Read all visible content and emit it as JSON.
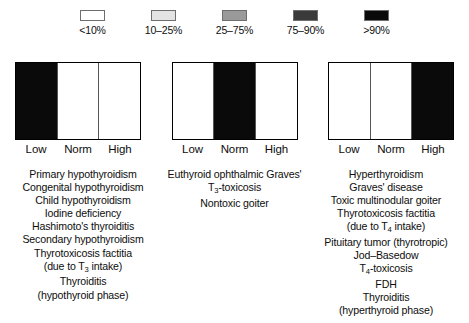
{
  "legend": {
    "items": [
      {
        "label": "<10%",
        "color": "#ffffff",
        "name": "legend-swatch-lt10"
      },
      {
        "label": "10–25%",
        "color": "#e3e3e3",
        "name": "legend-swatch-10-25"
      },
      {
        "label": "25–75%",
        "color": "#9a9a9a",
        "name": "legend-swatch-25-75"
      },
      {
        "label": "75–90%",
        "color": "#3a3a3a",
        "name": "legend-swatch-75-90"
      },
      {
        "label": ">90%",
        "color": "#0a0a0a",
        "name": "legend-swatch-gt90"
      }
    ]
  },
  "panels": [
    {
      "id": "panel-hypothyroid",
      "axis": [
        "Low",
        "Norm",
        "High"
      ],
      "bars": [
        {
          "segment": "Low",
          "color": "#0a0a0a",
          "band": ">90%"
        },
        {
          "segment": "Norm",
          "color": "#ffffff",
          "band": "<10%"
        },
        {
          "segment": "High",
          "color": "#ffffff",
          "band": "<10%"
        }
      ],
      "conditions": [
        "Primary hypothyroidism",
        "Congenital hypothyroidism",
        "Child hypothyroidism",
        "Iodine deficiency",
        "Hashimoto's thyroiditis",
        "Secondary hypothyroidism",
        "Thyrotoxicosis factitia",
        "(due to T<sub>3</sub> intake)",
        "Thyroiditis",
        "(hypothyroid phase)"
      ]
    },
    {
      "id": "panel-euthyroid",
      "axis": [
        "Low",
        "Norm",
        "High"
      ],
      "bars": [
        {
          "segment": "Low",
          "color": "#ffffff",
          "band": "<10%"
        },
        {
          "segment": "Norm",
          "color": "#0a0a0a",
          "band": ">90%"
        },
        {
          "segment": "High",
          "color": "#ffffff",
          "band": "<10%"
        }
      ],
      "conditions": [
        "Euthyroid ophthalmic Graves'",
        "T<sub>3</sub>-toxicosis",
        "Nontoxic goiter"
      ]
    },
    {
      "id": "panel-hyperthyroid",
      "axis": [
        "Low",
        "Norm",
        "High"
      ],
      "bars": [
        {
          "segment": "Low",
          "color": "#ffffff",
          "band": "<10%"
        },
        {
          "segment": "Norm",
          "color": "#ffffff",
          "band": "<10%"
        },
        {
          "segment": "High",
          "color": "#0a0a0a",
          "band": ">90%"
        }
      ],
      "conditions": [
        "Hyperthyroidism",
        "Graves' disease",
        "Toxic multinodular goiter",
        "Thyrotoxicosis factitia",
        "(due to T<sub>4</sub> intake)",
        "Pituitary tumor (thyrotropic)",
        "Jod–Basedow",
        "T<sub>4</sub>-toxicosis",
        "FDH",
        "Thyroiditis",
        "(hyperthyroid phase)"
      ]
    }
  ],
  "chart_data": {
    "type": "bar",
    "title": "",
    "xlabel": "",
    "ylabel": "",
    "categories": [
      "Low",
      "Norm",
      "High"
    ],
    "legend_position": "top",
    "grid": false,
    "legend_bands": [
      "<10%",
      "10–25%",
      "25–75%",
      "75–90%",
      ">90%"
    ],
    "series": [
      {
        "name": "Hypothyroid pattern",
        "values": [
          ">90%",
          "<10%",
          "<10%"
        ]
      },
      {
        "name": "Euthyroid pattern",
        "values": [
          "<10%",
          ">90%",
          "<10%"
        ]
      },
      {
        "name": "Hyperthyroid pattern",
        "values": [
          "<10%",
          "<10%",
          ">90%"
        ]
      }
    ]
  }
}
